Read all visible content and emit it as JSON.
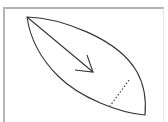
{
  "diagram": {
    "shape": "leaf-lens",
    "elements": [
      {
        "name": "lens-outline",
        "type": "closed-curve"
      },
      {
        "name": "direction-arrow",
        "type": "arrow"
      },
      {
        "name": "dotted-cross-line",
        "type": "dashed-line"
      }
    ],
    "colors": {
      "stroke": "#333333",
      "frame": "#b5b5b5",
      "background": "#ffffff"
    }
  }
}
